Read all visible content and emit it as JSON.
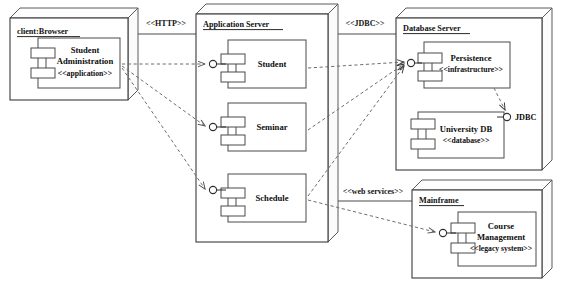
{
  "diagram": {
    "type": "deployment"
  },
  "nodes": [
    {
      "id": "client",
      "label": "client:Browser",
      "x": 10,
      "y": 18,
      "w": 118,
      "h": 82,
      "depth": 10
    },
    {
      "id": "app_server",
      "label": "Application Server",
      "x": 196,
      "y": 14,
      "w": 132,
      "h": 228,
      "depth": 10
    },
    {
      "id": "db_server",
      "label": "Database Server",
      "x": 396,
      "y": 18,
      "w": 146,
      "h": 152,
      "depth": 10
    },
    {
      "id": "mainframe",
      "label": "Mainframe",
      "x": 412,
      "y": 190,
      "w": 130,
      "h": 88,
      "depth": 10
    }
  ],
  "components": [
    {
      "id": "student_admin",
      "node": "client",
      "name": "Student\nAdministration",
      "name_lines": [
        "Student",
        "Administration"
      ],
      "stereotype": "<<application>>",
      "x": 38,
      "y": 38,
      "w": 82,
      "h": 50
    },
    {
      "id": "student",
      "node": "app_server",
      "name_lines": [
        "Student"
      ],
      "stereotype": "",
      "x": 228,
      "y": 40,
      "w": 78,
      "h": 48
    },
    {
      "id": "seminar",
      "node": "app_server",
      "name_lines": [
        "Seminar"
      ],
      "stereotype": "",
      "x": 228,
      "y": 103,
      "w": 78,
      "h": 48
    },
    {
      "id": "schedule",
      "node": "app_server",
      "name_lines": [
        "Schedule"
      ],
      "stereotype": "",
      "x": 228,
      "y": 174,
      "w": 78,
      "h": 48
    },
    {
      "id": "persistence",
      "node": "db_server",
      "name_lines": [
        "Persistence"
      ],
      "stereotype": "<<infrastructure>>",
      "x": 424,
      "y": 42,
      "w": 86,
      "h": 46
    },
    {
      "id": "university_db",
      "node": "db_server",
      "name_lines": [
        "University DB"
      ],
      "stereotype": "<<database>>",
      "x": 418,
      "y": 112,
      "w": 86,
      "h": 46
    },
    {
      "id": "course_management",
      "node": "mainframe",
      "name_lines": [
        "Course",
        "Management"
      ],
      "stereotype": "<<legacy system>>",
      "x": 458,
      "y": 212,
      "w": 78,
      "h": 54
    }
  ],
  "interfaces": [
    {
      "id": "iface_student",
      "label": "",
      "cx": 213,
      "cy": 64
    },
    {
      "id": "iface_seminar",
      "label": "",
      "cx": 213,
      "cy": 127
    },
    {
      "id": "iface_schedule",
      "label": "",
      "cx": 213,
      "cy": 190
    },
    {
      "id": "iface_persistence",
      "label": "",
      "cx": 411,
      "cy": 63
    },
    {
      "id": "iface_jdbc",
      "label": "JDBC",
      "cx": 507,
      "cy": 117
    },
    {
      "id": "iface_course",
      "label": "",
      "cx": 443,
      "cy": 233
    }
  ],
  "connections": [
    {
      "id": "conn_http",
      "label": "<<HTTP>>",
      "lx": 166,
      "ly": 26
    },
    {
      "id": "conn_jdbc",
      "label": "<<JDBC>>",
      "lx": 363,
      "ly": 26
    },
    {
      "id": "conn_webservices",
      "label": "<<web services>>",
      "lx": 370,
      "ly": 193
    }
  ],
  "colors": {
    "stroke": "#3a3a3a",
    "dashed": "#6d6d6d",
    "text": "#111111",
    "background": "#ffffff"
  }
}
